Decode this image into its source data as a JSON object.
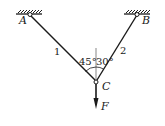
{
  "diagram": {
    "type": "two-bar truss / cable system",
    "supports": [
      {
        "id": "A",
        "label": "A"
      },
      {
        "id": "B",
        "label": "B"
      }
    ],
    "joint": {
      "id": "C",
      "label": "C"
    },
    "members": [
      {
        "id": "1",
        "label": "1",
        "from": "A",
        "to": "C"
      },
      {
        "id": "2",
        "label": "2",
        "from": "B",
        "to": "C"
      }
    ],
    "angles": [
      {
        "label": "45°",
        "between": "member 1 and vertical"
      },
      {
        "label": "30°",
        "between": "member 2 and vertical"
      }
    ],
    "load": {
      "label": "F",
      "direction": "down",
      "at": "C"
    },
    "colors": {
      "line": "#1a1a1a",
      "background": "#ffffff"
    }
  }
}
